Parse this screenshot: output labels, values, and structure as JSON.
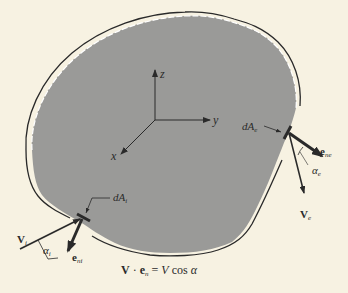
{
  "diagram": {
    "type": "control-volume",
    "colors": {
      "background": "#f7f2e2",
      "region_fill": "#9a9a98",
      "ink": "#2a2a2a",
      "boundary_gap": "#ffffff"
    },
    "axes": {
      "z_label": "z",
      "y_label": "y",
      "x_label": "x"
    },
    "inlet": {
      "area_label": "dA",
      "area_sub": "i",
      "velocity_label": "V",
      "velocity_sub": "i",
      "normal_label": "e",
      "normal_sub": "ni",
      "angle_label": "α",
      "angle_sub": "i"
    },
    "outlet": {
      "area_label": "dA",
      "area_sub": "e",
      "velocity_label": "V",
      "velocity_sub": "e",
      "normal_label": "e",
      "normal_sub": "ne",
      "angle_label": "α",
      "angle_sub": "e"
    },
    "equation": {
      "lhs_v": "V",
      "dot": "·",
      "lhs_e": "e",
      "lhs_e_sub": "n",
      "eq": "=",
      "rhs_v": "V",
      "rhs_rest": "cos",
      "rhs_alpha": "α"
    }
  }
}
